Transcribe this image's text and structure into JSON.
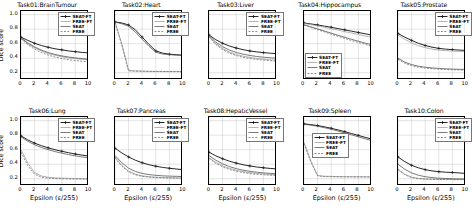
{
  "figure": {
    "rows": 2,
    "cols": 5,
    "shared_ylabel": "Dice score",
    "shared_xlabel": "Epsilon (ε/255)",
    "background": "#ffffff"
  },
  "series_style": {
    "SEAT-FT": {
      "color": "#1a1a1a",
      "dash": "none",
      "marker": "plus"
    },
    "FREE-FT": {
      "color": "#9a9a9a",
      "dash": "none",
      "marker": "none"
    },
    "SEAT": {
      "color": "#4d4d4d",
      "dash": "none",
      "marker": "none"
    },
    "FREE": {
      "color": "#6b6b6b",
      "dash": "dashed",
      "marker": "none"
    }
  },
  "legend_labels": [
    "SEAT-FT",
    "FREE-FT",
    "SEAT",
    "FREE"
  ],
  "chart_data": [
    {
      "type": "line",
      "title": "Task01:BrainTumour",
      "xlabel": "Epsilon (ε/255)",
      "ylabel": "Dice score",
      "xlim": [
        0,
        10
      ],
      "ylim": [
        0.1,
        1.05
      ],
      "xticks": [
        0,
        2,
        4,
        6,
        8,
        10
      ],
      "yticks": [
        0.2,
        0.4,
        0.6,
        0.8,
        1.0
      ],
      "ytick_labels": [
        "0.2",
        "0.4",
        "0.6",
        "0.8",
        "1.0"
      ],
      "grid": true,
      "legend_position": "upper right",
      "x": [
        0,
        1,
        2,
        3,
        4,
        5,
        6,
        7,
        8,
        9,
        10
      ],
      "series": [
        {
          "name": "SEAT-FT",
          "values": [
            0.69,
            0.645,
            0.605,
            0.575,
            0.55,
            0.53,
            0.515,
            0.5,
            0.49,
            0.48,
            0.472
          ]
        },
        {
          "name": "FREE-FT",
          "values": [
            0.675,
            0.6,
            0.545,
            0.5,
            0.465,
            0.44,
            0.42,
            0.405,
            0.395,
            0.385,
            0.378
          ]
        },
        {
          "name": "SEAT",
          "values": [
            0.68,
            0.61,
            0.555,
            0.512,
            0.478,
            0.452,
            0.432,
            0.416,
            0.404,
            0.394,
            0.386
          ]
        },
        {
          "name": "FREE",
          "values": [
            0.665,
            0.585,
            0.525,
            0.478,
            0.443,
            0.416,
            0.396,
            0.38,
            0.368,
            0.358,
            0.35
          ]
        }
      ]
    },
    {
      "type": "line",
      "title": "Task02:Heart",
      "xlabel": "Epsilon (ε/255)",
      "ylabel": "Dice score",
      "xlim": [
        0,
        10
      ],
      "ylim": [
        0.1,
        1.05
      ],
      "xticks": [
        0,
        2,
        4,
        6,
        8,
        10
      ],
      "yticks": [
        0.2,
        0.4,
        0.6,
        0.8,
        1.0
      ],
      "ytick_labels": [
        "0.2",
        "0.4",
        "0.6",
        "0.8",
        "1.0"
      ],
      "grid": true,
      "legend_position": "upper right",
      "x": [
        0,
        1,
        2,
        3,
        4,
        5,
        6,
        7,
        8,
        9,
        10
      ],
      "series": [
        {
          "name": "SEAT-FT",
          "values": [
            0.9,
            0.885,
            0.858,
            0.79,
            0.69,
            0.59,
            0.5,
            0.47,
            0.455,
            0.448,
            0.442
          ]
        },
        {
          "name": "FREE-FT",
          "values": [
            0.895,
            0.6,
            0.23,
            0.225,
            0.222,
            0.22,
            0.219,
            0.218,
            0.218,
            0.217,
            0.216
          ]
        },
        {
          "name": "SEAT",
          "values": [
            0.898,
            0.875,
            0.84,
            0.76,
            0.66,
            0.565,
            0.482,
            0.458,
            0.448,
            0.442,
            0.437
          ]
        },
        {
          "name": "FREE",
          "values": [
            0.892,
            0.58,
            0.225,
            0.222,
            0.22,
            0.218,
            0.217,
            0.216,
            0.216,
            0.215,
            0.215
          ]
        }
      ]
    },
    {
      "type": "line",
      "title": "Task03:Liver",
      "xlabel": "Epsilon (ε/255)",
      "ylabel": "Dice score",
      "xlim": [
        0,
        10
      ],
      "ylim": [
        0.1,
        1.05
      ],
      "xticks": [
        0,
        2,
        4,
        6,
        8,
        10
      ],
      "yticks": [
        0.2,
        0.4,
        0.6,
        0.8,
        1.0
      ],
      "ytick_labels": [
        "0.2",
        "0.4",
        "0.6",
        "0.8",
        "1.0"
      ],
      "grid": true,
      "legend_position": "upper right",
      "x": [
        0,
        1,
        2,
        3,
        4,
        5,
        6,
        7,
        8,
        9,
        10
      ],
      "series": [
        {
          "name": "SEAT-FT",
          "values": [
            0.72,
            0.655,
            0.605,
            0.568,
            0.54,
            0.518,
            0.5,
            0.487,
            0.477,
            0.469,
            0.462
          ]
        },
        {
          "name": "FREE-FT",
          "values": [
            0.7,
            0.6,
            0.532,
            0.485,
            0.452,
            0.428,
            0.41,
            0.397,
            0.387,
            0.379,
            0.373
          ]
        },
        {
          "name": "SEAT",
          "values": [
            0.71,
            0.622,
            0.558,
            0.512,
            0.48,
            0.456,
            0.438,
            0.424,
            0.414,
            0.406,
            0.4
          ]
        },
        {
          "name": "FREE",
          "values": [
            0.695,
            0.588,
            0.518,
            0.47,
            0.437,
            0.413,
            0.396,
            0.383,
            0.374,
            0.366,
            0.36
          ]
        }
      ]
    },
    {
      "type": "line",
      "title": "Task04:Hippocampus",
      "xlabel": "Epsilon (ε/255)",
      "ylabel": "Dice score",
      "xlim": [
        0,
        10
      ],
      "ylim": [
        0.1,
        1.05
      ],
      "xticks": [
        0,
        2,
        4,
        6,
        8,
        10
      ],
      "yticks": [
        0.2,
        0.4,
        0.6,
        0.8,
        1.0
      ],
      "ytick_labels": [
        "0.2",
        "0.4",
        "0.6",
        "0.8",
        "1.0"
      ],
      "grid": true,
      "legend_position": "lower left",
      "x": [
        0,
        1,
        2,
        3,
        4,
        5,
        6,
        7,
        8,
        9,
        10
      ],
      "series": [
        {
          "name": "SEAT-FT",
          "values": [
            0.885,
            0.872,
            0.858,
            0.842,
            0.826,
            0.808,
            0.79,
            0.772,
            0.754,
            0.736,
            0.718
          ]
        },
        {
          "name": "FREE-FT",
          "values": [
            0.878,
            0.862,
            0.845,
            0.826,
            0.807,
            0.787,
            0.766,
            0.746,
            0.726,
            0.706,
            0.687
          ]
        },
        {
          "name": "SEAT",
          "values": [
            0.86,
            0.832,
            0.803,
            0.774,
            0.745,
            0.716,
            0.688,
            0.66,
            0.634,
            0.608,
            0.584
          ]
        },
        {
          "name": "FREE",
          "values": [
            0.855,
            0.824,
            0.793,
            0.762,
            0.731,
            0.701,
            0.672,
            0.644,
            0.617,
            0.591,
            0.566
          ]
        }
      ]
    },
    {
      "type": "line",
      "title": "Task05:Prostate",
      "xlabel": "Epsilon (ε/255)",
      "ylabel": "Dice score",
      "xlim": [
        0,
        10
      ],
      "ylim": [
        0.1,
        1.05
      ],
      "xticks": [
        0,
        2,
        4,
        6,
        8,
        10
      ],
      "yticks": [
        0.2,
        0.4,
        0.6,
        0.8,
        1.0
      ],
      "ytick_labels": [
        "0.2",
        "0.4",
        "0.6",
        "0.8",
        "1.0"
      ],
      "grid": true,
      "legend_position": "upper right",
      "x": [
        0,
        1,
        2,
        3,
        4,
        5,
        6,
        7,
        8,
        9,
        10
      ],
      "series": [
        {
          "name": "SEAT-FT",
          "values": [
            0.74,
            0.69,
            0.645,
            0.605,
            0.575,
            0.552,
            0.535,
            0.525,
            0.518,
            0.512,
            0.508
          ]
        },
        {
          "name": "FREE-FT",
          "values": [
            0.72,
            0.66,
            0.61,
            0.572,
            0.545,
            0.525,
            0.512,
            0.504,
            0.498,
            0.494,
            0.49
          ]
        },
        {
          "name": "SEAT",
          "values": [
            0.4,
            0.345,
            0.312,
            0.29,
            0.276,
            0.266,
            0.259,
            0.254,
            0.25,
            0.247,
            0.245
          ]
        },
        {
          "name": "FREE",
          "values": [
            0.385,
            0.33,
            0.298,
            0.277,
            0.264,
            0.255,
            0.249,
            0.244,
            0.241,
            0.238,
            0.236
          ]
        }
      ]
    },
    {
      "type": "line",
      "title": "Task06:Lung",
      "xlabel": "Epsilon (ε/255)",
      "ylabel": "Dice score",
      "xlim": [
        0,
        10
      ],
      "ylim": [
        0.1,
        1.05
      ],
      "xticks": [
        0,
        2,
        4,
        6,
        8,
        10
      ],
      "yticks": [
        0.2,
        0.4,
        0.6,
        0.8,
        1.0
      ],
      "ytick_labels": [
        "0.2",
        "0.4",
        "0.6",
        "0.8",
        "1.0"
      ],
      "grid": true,
      "legend_position": "upper right",
      "x": [
        0,
        1,
        2,
        3,
        4,
        5,
        6,
        7,
        8,
        9,
        10
      ],
      "series": [
        {
          "name": "SEAT-FT",
          "values": [
            0.79,
            0.735,
            0.69,
            0.655,
            0.625,
            0.6,
            0.578,
            0.558,
            0.54,
            0.525,
            0.512
          ]
        },
        {
          "name": "FREE-FT",
          "values": [
            0.6,
            0.415,
            0.285,
            0.238,
            0.22,
            0.212,
            0.208,
            0.205,
            0.203,
            0.202,
            0.2
          ]
        },
        {
          "name": "SEAT",
          "values": [
            0.775,
            0.715,
            0.668,
            0.63,
            0.6,
            0.574,
            0.552,
            0.532,
            0.515,
            0.5,
            0.488
          ]
        },
        {
          "name": "FREE",
          "values": [
            0.565,
            0.38,
            0.262,
            0.222,
            0.208,
            0.202,
            0.199,
            0.197,
            0.196,
            0.195,
            0.194
          ]
        }
      ]
    },
    {
      "type": "line",
      "title": "Task07:Pancreas",
      "xlabel": "Epsilon (ε/255)",
      "ylabel": "Dice score",
      "xlim": [
        0,
        10
      ],
      "ylim": [
        0.1,
        1.05
      ],
      "xticks": [
        0,
        2,
        4,
        6,
        8,
        10
      ],
      "yticks": [
        0.2,
        0.4,
        0.6,
        0.8,
        1.0
      ],
      "ytick_labels": [
        "0.2",
        "0.4",
        "0.6",
        "0.8",
        "1.0"
      ],
      "grid": true,
      "legend_position": "upper right",
      "x": [
        0,
        1,
        2,
        3,
        4,
        5,
        6,
        7,
        8,
        9,
        10
      ],
      "series": [
        {
          "name": "SEAT-FT",
          "values": [
            0.62,
            0.555,
            0.5,
            0.455,
            0.42,
            0.393,
            0.372,
            0.356,
            0.344,
            0.334,
            0.326
          ]
        },
        {
          "name": "FREE-FT",
          "values": [
            0.5,
            0.385,
            0.305,
            0.262,
            0.24,
            0.228,
            0.221,
            0.217,
            0.214,
            0.212,
            0.21
          ]
        },
        {
          "name": "SEAT",
          "values": [
            0.52,
            0.42,
            0.345,
            0.3,
            0.273,
            0.257,
            0.247,
            0.24,
            0.236,
            0.233,
            0.23
          ]
        },
        {
          "name": "FREE",
          "values": [
            0.485,
            0.372,
            0.295,
            0.254,
            0.233,
            0.222,
            0.216,
            0.212,
            0.21,
            0.208,
            0.206
          ]
        }
      ]
    },
    {
      "type": "line",
      "title": "Task08:HepaticVessel",
      "xlabel": "Epsilon (ε/255)",
      "ylabel": "Dice score",
      "xlim": [
        0,
        10
      ],
      "ylim": [
        0.1,
        1.05
      ],
      "xticks": [
        0,
        2,
        4,
        6,
        8,
        10
      ],
      "yticks": [
        0.2,
        0.4,
        0.6,
        0.8,
        1.0
      ],
      "ytick_labels": [
        "0.2",
        "0.4",
        "0.6",
        "0.8",
        "1.0"
      ],
      "grid": true,
      "legend_position": "upper right",
      "x": [
        0,
        1,
        2,
        3,
        4,
        5,
        6,
        7,
        8,
        9,
        10
      ],
      "series": [
        {
          "name": "SEAT-FT",
          "values": [
            0.565,
            0.515,
            0.475,
            0.442,
            0.415,
            0.393,
            0.376,
            0.362,
            0.351,
            0.342,
            0.335
          ]
        },
        {
          "name": "FREE-FT",
          "values": [
            0.49,
            0.425,
            0.378,
            0.343,
            0.317,
            0.298,
            0.284,
            0.273,
            0.265,
            0.259,
            0.254
          ]
        },
        {
          "name": "SEAT",
          "values": [
            0.52,
            0.455,
            0.405,
            0.367,
            0.339,
            0.318,
            0.302,
            0.29,
            0.281,
            0.274,
            0.268
          ]
        },
        {
          "name": "FREE",
          "values": [
            0.48,
            0.412,
            0.362,
            0.327,
            0.302,
            0.284,
            0.271,
            0.261,
            0.254,
            0.248,
            0.244
          ]
        }
      ]
    },
    {
      "type": "line",
      "title": "Task09:Spleen",
      "xlabel": "Epsilon (ε/255)",
      "ylabel": "Dice score",
      "xlim": [
        0,
        10
      ],
      "ylim": [
        0.1,
        1.05
      ],
      "xticks": [
        0,
        2,
        4,
        6,
        8,
        10
      ],
      "yticks": [
        0.2,
        0.4,
        0.6,
        0.8,
        1.0
      ],
      "ytick_labels": [
        "0.2",
        "0.4",
        "0.6",
        "0.8",
        "1.0"
      ],
      "grid": true,
      "legend_position": "center left",
      "x": [
        0,
        1,
        2,
        3,
        4,
        5,
        6,
        7,
        8,
        9,
        10
      ],
      "series": [
        {
          "name": "SEAT-FT",
          "values": [
            0.955,
            0.945,
            0.932,
            0.915,
            0.895,
            0.872,
            0.848,
            0.822,
            0.796,
            0.77,
            0.745
          ]
        },
        {
          "name": "FREE-FT",
          "values": [
            0.7,
            0.45,
            0.245,
            0.235,
            0.232,
            0.23,
            0.229,
            0.228,
            0.228,
            0.227,
            0.227
          ]
        },
        {
          "name": "SEAT",
          "values": [
            0.95,
            0.938,
            0.922,
            0.903,
            0.881,
            0.857,
            0.831,
            0.804,
            0.777,
            0.75,
            0.724
          ]
        },
        {
          "name": "FREE",
          "values": [
            0.685,
            0.43,
            0.238,
            0.23,
            0.228,
            0.226,
            0.225,
            0.225,
            0.224,
            0.224,
            0.224
          ]
        }
      ]
    },
    {
      "type": "line",
      "title": "Task10:Colon",
      "xlabel": "Epsilon (ε/255)",
      "ylabel": "Dice score",
      "xlim": [
        0,
        10
      ],
      "ylim": [
        0.1,
        1.05
      ],
      "xticks": [
        0,
        2,
        4,
        6,
        8,
        10
      ],
      "yticks": [
        0.2,
        0.4,
        0.6,
        0.8,
        1.0
      ],
      "ytick_labels": [
        "0.2",
        "0.4",
        "0.6",
        "0.8",
        "1.0"
      ],
      "grid": true,
      "legend_position": "upper right",
      "x": [
        0,
        1,
        2,
        3,
        4,
        5,
        6,
        7,
        8,
        9,
        10
      ],
      "series": [
        {
          "name": "SEAT-FT",
          "values": [
            0.5,
            0.435,
            0.385,
            0.35,
            0.325,
            0.308,
            0.297,
            0.29,
            0.286,
            0.28,
            0.272
          ]
        },
        {
          "name": "FREE-FT",
          "values": [
            0.33,
            0.262,
            0.222,
            0.205,
            0.198,
            0.195,
            0.193,
            0.192,
            0.191,
            0.191,
            0.19
          ]
        },
        {
          "name": "SEAT",
          "values": [
            0.4,
            0.33,
            0.28,
            0.248,
            0.228,
            0.216,
            0.208,
            0.203,
            0.2,
            0.198,
            0.196
          ]
        },
        {
          "name": "FREE",
          "values": [
            0.325,
            0.255,
            0.216,
            0.2,
            0.194,
            0.191,
            0.19,
            0.189,
            0.188,
            0.188,
            0.188
          ]
        }
      ]
    }
  ]
}
